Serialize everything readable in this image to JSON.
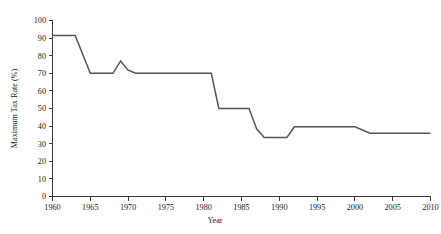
{
  "figure": {
    "background_color": "#ffffff",
    "line_color": "#555555",
    "axis_color": "#3a3a3a"
  },
  "chart_data": {
    "type": "line",
    "title": "",
    "xlabel": "Year",
    "ylabel": "Maximum Tax Rate (%)",
    "xlim": [
      1960,
      2010
    ],
    "ylim": [
      0,
      100
    ],
    "grid": false,
    "legend": false,
    "x_ticks": [
      1960,
      1965,
      1970,
      1975,
      1980,
      1985,
      1990,
      1995,
      2000,
      2005,
      2010
    ],
    "x_tick_labels": [
      "1960",
      "1965",
      "1970",
      "1975",
      "1980",
      "1985",
      "1990",
      "1995",
      "2000",
      "2005",
      "2010"
    ],
    "y_ticks": [
      0,
      10,
      20,
      30,
      40,
      50,
      60,
      70,
      80,
      90,
      100
    ],
    "y_tick_labels": [
      "0",
      "10",
      "20",
      "30",
      "40",
      "50",
      "60",
      "70",
      "80",
      "90",
      "100"
    ],
    "series": [
      {
        "name": "Maximum Tax Rate",
        "color": "#555555",
        "x": [
          1960,
          1963,
          1965,
          1968,
          1969,
          1970,
          1971,
          1981,
          1982,
          1986,
          1987,
          1988,
          1991,
          1992,
          2000,
          2002,
          2010
        ],
        "values": [
          91.5,
          91.5,
          70,
          70,
          77,
          71.8,
          70,
          70,
          50,
          50,
          38.5,
          33.5,
          33.5,
          39.6,
          39.6,
          36,
          36
        ]
      }
    ]
  },
  "axis_labels": {
    "x_title": "Year",
    "y_title": "Maximum Tax Rate (%)"
  }
}
